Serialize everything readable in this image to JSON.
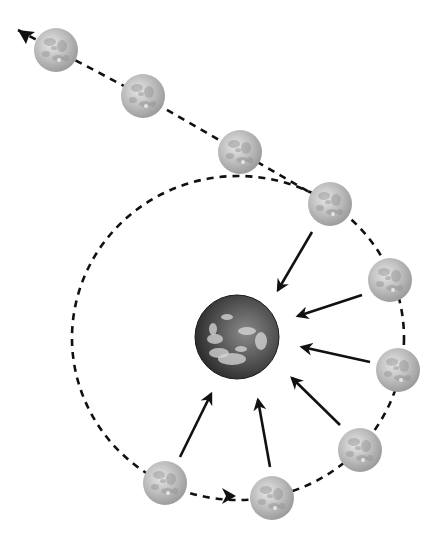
{
  "diagram": {
    "type": "moon-escape-orbit",
    "background": "#ffffff",
    "line_color": "#111111",
    "earth": {
      "cx": 237,
      "cy": 337,
      "r": 42
    },
    "orbit": {
      "cx": 238,
      "cy": 338,
      "rx": 166,
      "ry": 162
    },
    "escape_path": [
      [
        18,
        30
      ],
      [
        56,
        50
      ],
      [
        143,
        96
      ],
      [
        240,
        152
      ],
      [
        330,
        204
      ]
    ],
    "moons": [
      {
        "id": 1,
        "cx": 56,
        "cy": 50
      },
      {
        "id": 2,
        "cx": 143,
        "cy": 96
      },
      {
        "id": 3,
        "cx": 240,
        "cy": 152
      },
      {
        "id": 4,
        "cx": 330,
        "cy": 204
      },
      {
        "id": 5,
        "cx": 390,
        "cy": 280
      },
      {
        "id": 6,
        "cx": 398,
        "cy": 370
      },
      {
        "id": 7,
        "cx": 360,
        "cy": 450
      },
      {
        "id": 8,
        "cx": 272,
        "cy": 498
      },
      {
        "id": 9,
        "cx": 165,
        "cy": 483
      }
    ],
    "moon_radius": 22,
    "gravity_arrows": [
      {
        "from": [
          312,
          232
        ],
        "to": [
          278,
          290
        ]
      },
      {
        "from": [
          362,
          295
        ],
        "to": [
          298,
          316
        ]
      },
      {
        "from": [
          370,
          362
        ],
        "to": [
          302,
          347
        ]
      },
      {
        "from": [
          340,
          425
        ],
        "to": [
          292,
          378
        ]
      },
      {
        "from": [
          270,
          467
        ],
        "to": [
          258,
          400
        ]
      },
      {
        "from": [
          180,
          457
        ],
        "to": [
          211,
          394
        ]
      }
    ],
    "direction_arrows": [
      {
        "position": [
          18,
          30
        ],
        "direction": "up-left"
      },
      {
        "position": [
          222,
          496
        ],
        "direction": "right"
      }
    ]
  }
}
